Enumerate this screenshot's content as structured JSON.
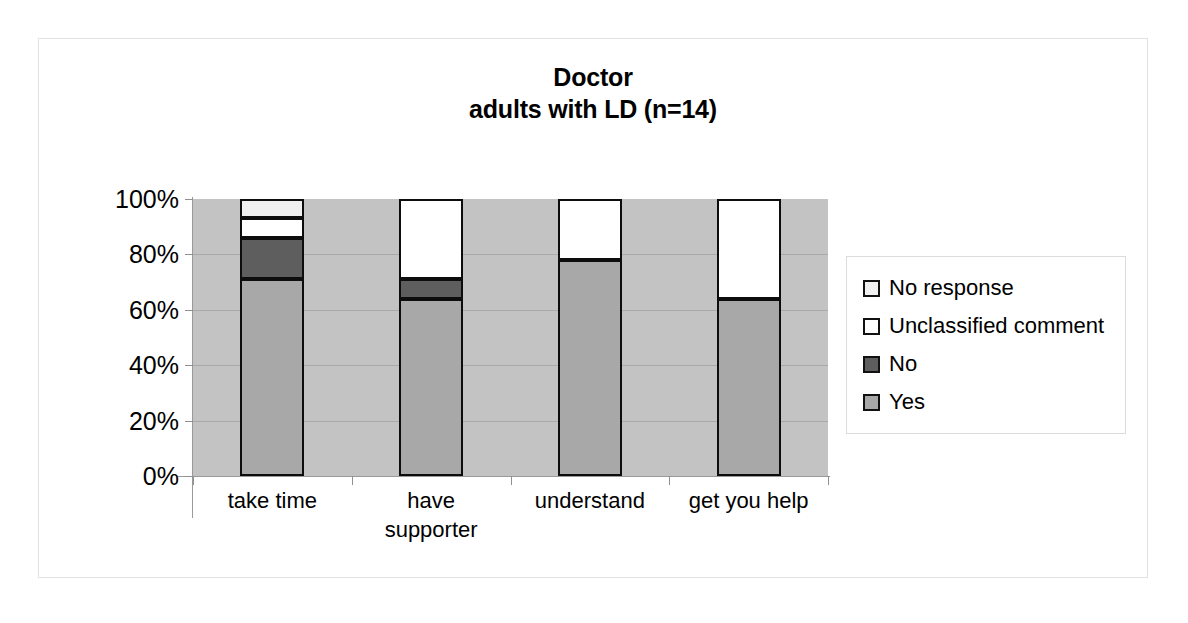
{
  "chart_data": {
    "type": "bar",
    "subtype": "stacked-percent",
    "title": "Doctor",
    "subtitle": "adults with LD (n=14)",
    "xlabel": "",
    "ylabel": "",
    "ylim": [
      0,
      100
    ],
    "ytick_labels": [
      "100%",
      "80%",
      "60%",
      "40%",
      "20%",
      "0%"
    ],
    "ytick_values": [
      100,
      80,
      60,
      40,
      20,
      0
    ],
    "grid": true,
    "legend_position": "right",
    "categories": [
      "take time",
      "have\nsupporter",
      "understand",
      "get you help"
    ],
    "series": [
      {
        "name": "Yes",
        "color": "#a8a8a8",
        "values": [
          71,
          64,
          78,
          64
        ]
      },
      {
        "name": "No",
        "color": "#5e5e5e",
        "values": [
          15,
          7,
          0,
          0
        ]
      },
      {
        "name": "Unclassified comment",
        "color": "#ffffff",
        "values": [
          7,
          29,
          22,
          36
        ]
      },
      {
        "name": "No response",
        "color": "#f0f0f0",
        "values": [
          7,
          0,
          0,
          0
        ]
      }
    ],
    "stack_order_bottom_to_top": [
      "Yes",
      "No",
      "Unclassified comment",
      "No response"
    ],
    "plot_background": "#c3c3c3"
  },
  "title": {
    "line1": "Doctor",
    "line2": "adults with LD (n=14)"
  },
  "y_axis": {
    "ticks": [
      {
        "label": "100%",
        "value": 100
      },
      {
        "label": "80%",
        "value": 80
      },
      {
        "label": "60%",
        "value": 60
      },
      {
        "label": "40%",
        "value": 40
      },
      {
        "label": "20%",
        "value": 20
      },
      {
        "label": "0%",
        "value": 0
      }
    ]
  },
  "x_axis": {
    "categories": [
      {
        "label": "take time"
      },
      {
        "label": "have\nsupporter"
      },
      {
        "label": "understand"
      },
      {
        "label": "get you help"
      }
    ]
  },
  "legend": {
    "items": [
      {
        "label": "No response",
        "color": "#f0f0f0"
      },
      {
        "label": "Unclassified comment",
        "color": "#ffffff"
      },
      {
        "label": "No",
        "color": "#5e5e5e"
      },
      {
        "label": "Yes",
        "color": "#a8a8a8"
      }
    ]
  }
}
